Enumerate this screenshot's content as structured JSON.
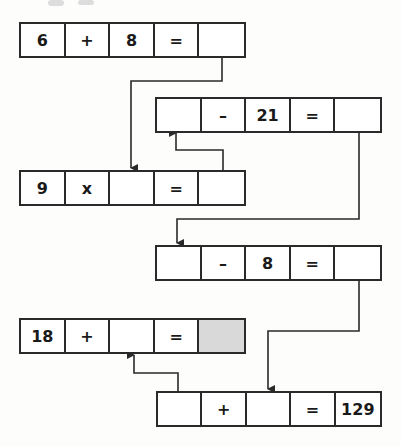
{
  "puzzle": {
    "rows": [
      {
        "cells": [
          "6",
          "+",
          "8",
          "=",
          ""
        ]
      },
      {
        "cells": [
          "",
          "–",
          "21",
          "=",
          ""
        ]
      },
      {
        "cells": [
          "9",
          "x",
          "",
          "=",
          ""
        ]
      },
      {
        "cells": [
          "",
          "–",
          "8",
          "=",
          ""
        ]
      },
      {
        "cells": [
          "18",
          "+",
          "",
          "=",
          ""
        ]
      },
      {
        "cells": [
          "",
          "+",
          "",
          "=",
          "129"
        ]
      }
    ],
    "shaded_cell": "row 5, cell 5",
    "colors": {
      "line": "#2a2a2a",
      "shaded": "#d9d9d9"
    }
  }
}
